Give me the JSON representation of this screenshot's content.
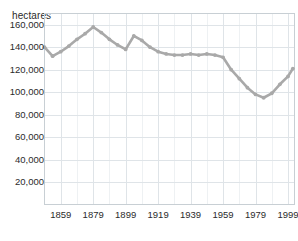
{
  "chart_data": {
    "type": "line",
    "title": "",
    "subtitle": "",
    "xlabel": "",
    "ylabel": "hectares",
    "ylabel_position": "top-left",
    "grid": true,
    "legend": false,
    "legend_position": "none",
    "line_color": "#a9a9a9",
    "grid_color": "#dfe4e8",
    "border_color": "#c8cfd4",
    "background_color": "#ffffff",
    "text_color": "#2b2b2b",
    "xlim": [
      1849,
      2003
    ],
    "ylim": [
      0,
      170000
    ],
    "yticks": [
      20000,
      40000,
      60000,
      80000,
      100000,
      120000,
      140000,
      160000
    ],
    "ytick_labels": [
      "20,000",
      "40,000",
      "60,000",
      "80,000",
      "100,000",
      "120,000",
      "140,000",
      "160,000"
    ],
    "xticks": [
      1859,
      1879,
      1899,
      1919,
      1939,
      1959,
      1979,
      1999
    ],
    "xtick_labels": [
      "1859",
      "1879",
      "1899",
      "1919",
      "1939",
      "1959",
      "1979",
      "1999"
    ],
    "x_minor_step": 10,
    "markers": true,
    "x": [
      1849,
      1854,
      1859,
      1864,
      1869,
      1874,
      1879,
      1884,
      1889,
      1894,
      1899,
      1904,
      1909,
      1914,
      1919,
      1924,
      1929,
      1934,
      1939,
      1944,
      1949,
      1954,
      1959,
      1964,
      1969,
      1974,
      1979,
      1984,
      1989,
      1994,
      1999,
      2002
    ],
    "values": [
      140000,
      132000,
      136000,
      141000,
      147000,
      152000,
      158000,
      153000,
      147000,
      142000,
      138000,
      150000,
      146000,
      140000,
      136000,
      134000,
      133000,
      133000,
      134000,
      133000,
      134000,
      133000,
      131000,
      120000,
      112000,
      104000,
      98000,
      95000,
      99000,
      107000,
      114000,
      121000
    ],
    "ylabel_text": "hectares"
  }
}
